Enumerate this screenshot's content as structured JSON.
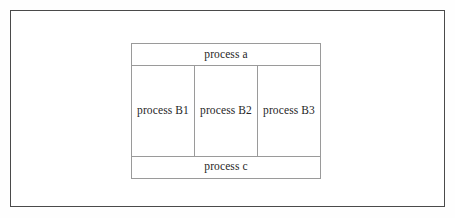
{
  "figure": {
    "frame_color": "#4a4a4a",
    "cell_border_color": "#9a9a9a",
    "background_color": "#ffffff",
    "text_color": "#262626",
    "top_row": {
      "label": "process a"
    },
    "middle_row": {
      "cells": [
        {
          "label": "process B1"
        },
        {
          "label": "process B2"
        },
        {
          "label": "process B3"
        }
      ]
    },
    "bottom_row": {
      "label": "process c"
    }
  }
}
